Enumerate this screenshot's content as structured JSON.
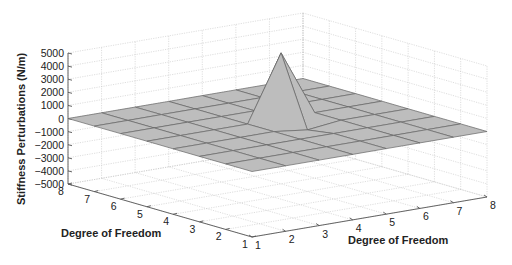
{
  "chart_data": {
    "type": "surface3d",
    "title": "",
    "zlabel": "Stiffness Perturbations (N/m)",
    "xlabel": "Degree of Freedom",
    "ylabel": "Degree of Freedom",
    "zlim": [
      -5000,
      5000
    ],
    "zticks": [
      "5000",
      "4000",
      "3000",
      "2000",
      "1000",
      "0",
      "−1000",
      "−2000",
      "−3000",
      "−4000",
      "−5000"
    ],
    "xlim": [
      1,
      8
    ],
    "ylim": [
      1,
      8
    ],
    "left_axis_ticks": [
      "8",
      "7",
      "6",
      "5",
      "4",
      "3",
      "2",
      "1"
    ],
    "right_axis_ticks": [
      "1",
      "2",
      "3",
      "4",
      "5",
      "6",
      "7",
      "8"
    ],
    "grid": true,
    "surface_color": "#bdbdbd",
    "values": [
      [
        0,
        0,
        0,
        0,
        0,
        0,
        0,
        0
      ],
      [
        0,
        0,
        0,
        0,
        0,
        0,
        0,
        0
      ],
      [
        0,
        0,
        0,
        0,
        0,
        0,
        0,
        0
      ],
      [
        0,
        0,
        0,
        0,
        -300,
        0,
        0,
        0
      ],
      [
        0,
        0,
        0,
        0,
        5000,
        0,
        0,
        0
      ],
      [
        0,
        0,
        0,
        0,
        0,
        0,
        0,
        0
      ],
      [
        0,
        0,
        0,
        0,
        0,
        0,
        0,
        0
      ],
      [
        0,
        0,
        0,
        0,
        0,
        0,
        0,
        0
      ]
    ],
    "peak": {
      "dof_x": 5,
      "dof_y": 5,
      "value": 5000
    },
    "negative_spike": {
      "approx_value": -1300
    }
  }
}
